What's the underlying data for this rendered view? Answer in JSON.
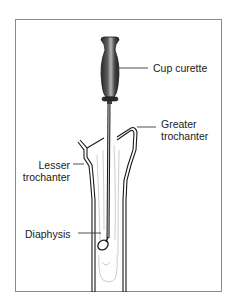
{
  "figure": {
    "type": "anatomical-illustration",
    "colors": {
      "frame": "#8a8a8a",
      "line": "#1a1a1a",
      "handle_dark": "#2a2a2a",
      "handle_mid": "#6a6a6a",
      "handle_light": "#b5b5b5",
      "text": "#1a1a1a"
    }
  },
  "labels": {
    "cup_curette": "Cup curette",
    "greater_trochanter_line1": "Greater",
    "greater_trochanter_line2": "trochanter",
    "lesser_trochanter_line1": "Lesser",
    "lesser_trochanter_line2": "trochanter",
    "diaphysis": "Diaphysis"
  }
}
